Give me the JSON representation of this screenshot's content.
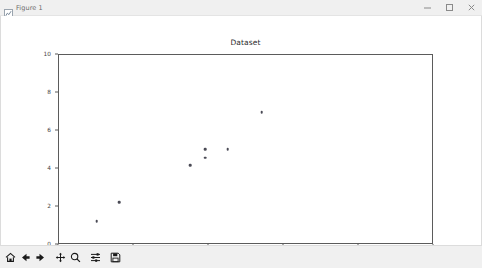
{
  "window": {
    "title": "Figure 1",
    "icon": "figure-icon",
    "controls": {
      "minimize": "–",
      "maximize": "□",
      "close": "×"
    }
  },
  "toolbar": {
    "buttons": [
      {
        "name": "home-button",
        "label": "Home",
        "icon": "home-icon"
      },
      {
        "name": "back-button",
        "label": "Back",
        "icon": "arrow-left-icon"
      },
      {
        "name": "forward-button",
        "label": "Forward",
        "icon": "arrow-right-icon"
      },
      {
        "name": "pan-button",
        "label": "Pan",
        "icon": "move-cross-icon"
      },
      {
        "name": "zoom-button",
        "label": "Zoom to rectangle",
        "icon": "magnifier-icon"
      },
      {
        "name": "configure-subplots-button",
        "label": "Configure subplots",
        "icon": "sliders-icon"
      },
      {
        "name": "save-button",
        "label": "Save the figure",
        "icon": "floppy-disk-icon"
      }
    ],
    "coordinates": ""
  },
  "chart_data": {
    "type": "scatter",
    "title": "Dataset",
    "xlabel": "",
    "ylabel": "",
    "xlim": [
      0,
      10
    ],
    "ylim": [
      0,
      10
    ],
    "xticks": [
      0,
      2,
      4,
      6,
      8,
      10
    ],
    "yticks": [
      0,
      2,
      4,
      6,
      8,
      10
    ],
    "grid": false,
    "legend": null,
    "marker": {
      "shape": "circle",
      "color": "#4a4a55",
      "size": 2.6
    },
    "points": [
      {
        "x": 1.0,
        "y": 1.25
      },
      {
        "x": 1.6,
        "y": 2.25
      },
      {
        "x": 3.5,
        "y": 4.2
      },
      {
        "x": 3.9,
        "y": 5.05
      },
      {
        "x": 3.9,
        "y": 4.6
      },
      {
        "x": 4.5,
        "y": 5.05
      },
      {
        "x": 5.4,
        "y": 7.0
      }
    ],
    "series": [
      {
        "name": "Dataset",
        "x": [
          1.0,
          1.6,
          3.5,
          3.9,
          3.9,
          4.5,
          5.4
        ],
        "y": [
          1.25,
          2.25,
          4.2,
          5.05,
          4.6,
          5.05,
          7.0
        ]
      }
    ]
  }
}
